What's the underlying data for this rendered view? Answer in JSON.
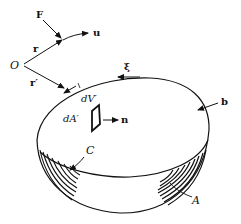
{
  "figure": {
    "colors": {
      "ink": "#111111",
      "background": "#ffffff"
    },
    "labels": {
      "force": "F",
      "unit_vector_u": "u",
      "origin": "O",
      "position_r": "r",
      "position_r_prime": "r′",
      "xi": "ξ",
      "b": "b",
      "volume_element": "dV′",
      "area_element": "dA′",
      "normal": "n",
      "curve": "C",
      "surface": "A"
    }
  }
}
